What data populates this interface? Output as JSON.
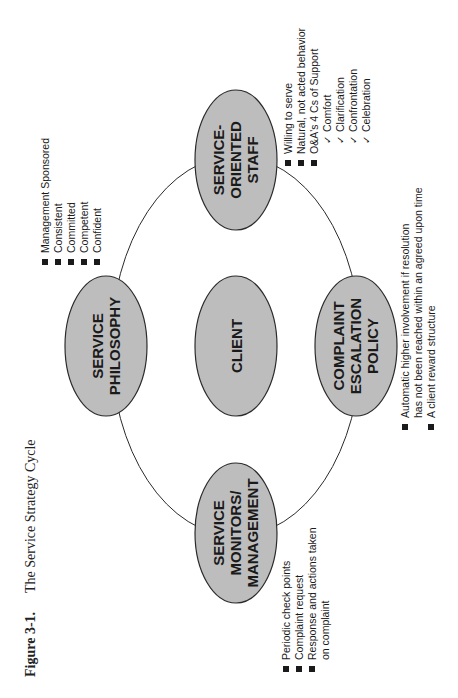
{
  "figure": {
    "number": "Figure 3-1.",
    "title": "The Service Strategy Cycle"
  },
  "colors": {
    "node_fill": "#bdbdbd",
    "stroke": "#2a2a2a",
    "text": "#1a1a1a"
  },
  "nodes": {
    "philosophy": {
      "lines": [
        "SERVICE",
        "PHILOSOPHY"
      ]
    },
    "staff": {
      "lines": [
        "SERVICE-",
        "ORIENTED",
        "STAFF"
      ]
    },
    "client": {
      "lines": [
        "CLIENT"
      ]
    },
    "complaint": {
      "lines": [
        "COMPLAINT",
        "ESCALATION",
        "POLICY"
      ]
    },
    "monitors": {
      "lines": [
        "SERVICE",
        "MONITORS/",
        "MANAGEMENT"
      ]
    }
  },
  "bullets": {
    "philosophy": [
      "Management Sponsored",
      "Consistent",
      "Committed",
      "Competent",
      "Confident"
    ],
    "staff": {
      "items": [
        "Willing to serve",
        "Natural, not acted behavior",
        "O&A's 4 Cs of Support"
      ],
      "sub_items": [
        "Comfort",
        "Clarification",
        "Confrontation",
        "Celebration"
      ]
    },
    "complaint": {
      "item1_line1": "Automatic higher involvement if resolution",
      "item1_line2": "has not been reached within an agreed upon time",
      "item2": "A client reward structure"
    },
    "monitors": {
      "item1": "Periodic check points",
      "item2": "Complaint request",
      "item3_line1": "Response and actions taken",
      "item3_line2": "on complaint"
    }
  },
  "icons": {
    "bullet": "square-bullet-icon",
    "check": "checkmark-icon",
    "check_glyph": "✓"
  }
}
